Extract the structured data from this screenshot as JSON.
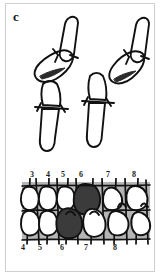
{
  "figure": {
    "panel_label": "c",
    "background_color": "#ffffff",
    "frame_color": "#cfcfcf",
    "ink_color": "#111111",
    "band_color": "#b5b5b5",
    "shaded_tooth_color": "#3b3b3b",
    "tooth_fill_color": "#ffffff"
  },
  "upper_drawings": {
    "name": "tooth-pair-wear-facet-drawings",
    "count": 2,
    "items": [
      {
        "id": "left-tooth-pair",
        "description": "upper and lower tooth pair in occlusion with dark wear facet wedge",
        "facet_marker": "dark-wedge"
      },
      {
        "id": "right-tooth-pair",
        "description": "upper and lower tooth pair separated with dark wear facet wedge",
        "facet_marker": "dark-wedge"
      }
    ]
  },
  "arch_diagram": {
    "name": "dental-arch-occlusion-diagram",
    "upper_numbers": [
      "3",
      "4",
      "5",
      "6",
      "7",
      "8"
    ],
    "lower_numbers": [
      "4",
      "5",
      "6",
      "7",
      "8"
    ],
    "upper_number_positions": [
      22,
      38,
      53,
      71,
      98,
      124
    ],
    "lower_number_positions": [
      13,
      30,
      52,
      76,
      105
    ],
    "shaded_teeth": [
      {
        "arch": "upper",
        "number": "6"
      },
      {
        "arch": "lower",
        "number": "6"
      }
    ]
  }
}
